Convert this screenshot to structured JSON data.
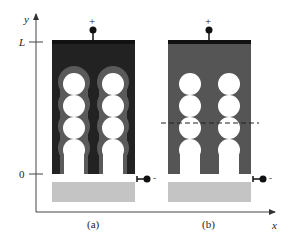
{
  "axes": {
    "y_label": "y",
    "x_label": "x",
    "y_ticks": [
      {
        "label": "L",
        "y": 42
      },
      {
        "label": "0",
        "y": 174
      }
    ]
  },
  "panels": [
    {
      "id": "a",
      "caption": "(a)",
      "fill": "#222222",
      "halo": "#5a5a5a",
      "dashed_line": false,
      "top_terminal": "+",
      "side_terminal": "-"
    },
    {
      "id": "b",
      "caption": "(b)",
      "fill": "#555555",
      "halo": "#555555",
      "dashed_line": true,
      "top_terminal": "+",
      "side_terminal": "-"
    }
  ],
  "colors": {
    "axis": "#444444",
    "bottom_electrode": "#c4c4c4",
    "top_bar": "#111111"
  }
}
